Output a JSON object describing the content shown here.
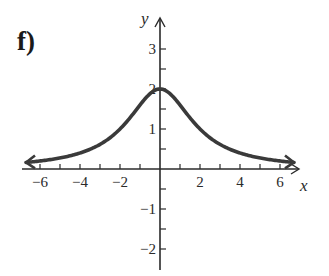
{
  "figure": {
    "part_label": "f)"
  },
  "chart_data": {
    "type": "line",
    "title": "f)",
    "xlabel": "x",
    "ylabel": "y",
    "xlim": [
      -7,
      7
    ],
    "ylim": [
      -2.5,
      3.5
    ],
    "x_ticks": [
      -6,
      -5,
      -4,
      -3,
      -2,
      -1,
      1,
      2,
      3,
      4,
      5,
      6
    ],
    "x_tick_labels": [
      "-6",
      "-4",
      "-2",
      "2",
      "4",
      "6"
    ],
    "x_tick_label_values": [
      -6,
      -4,
      -2,
      2,
      4,
      6
    ],
    "y_ticks": [
      -2,
      -1.5,
      -1,
      -0.5,
      0.5,
      1,
      1.5,
      2,
      2.5,
      3
    ],
    "y_tick_labels": [
      "3",
      "2",
      "1",
      "-1",
      "-2"
    ],
    "y_tick_label_values": [
      3,
      2,
      1,
      -1,
      -2
    ],
    "grid": false,
    "legend": null,
    "curve_description": "Bell-shaped curve symmetric about y-axis, maximum at (0, 2), approaching 0 as x → ±∞; arrowheads on both ends",
    "series": [
      {
        "name": "f(x)",
        "x": [
          -6.7,
          -6,
          -5,
          -4,
          -3,
          -2,
          -1,
          0,
          1,
          2,
          3,
          4,
          5,
          6,
          6.7
        ],
        "values": [
          0.16,
          0.2,
          0.28,
          0.4,
          0.62,
          1.0,
          1.6,
          2.0,
          1.6,
          1.0,
          0.62,
          0.4,
          0.28,
          0.2,
          0.16
        ],
        "color": "#3a3a3a",
        "arrows": "both"
      }
    ],
    "colors": {
      "curve": "#3a3a3a",
      "axes": "#2a2a2a",
      "text": "#2a2a2a"
    }
  }
}
